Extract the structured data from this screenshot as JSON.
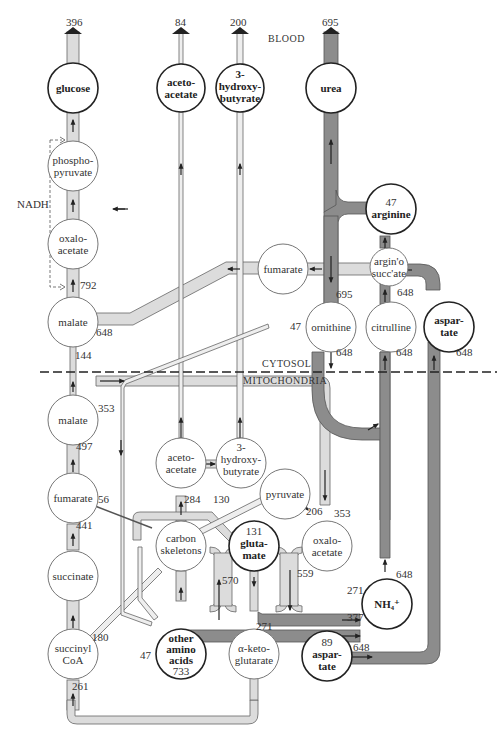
{
  "regions": {
    "blood": "BLOOD",
    "cytosol": "CYTOSOL",
    "mitochondria": "MITOCHONDRIA"
  },
  "cofactor_label": "NADH",
  "colors": {
    "light_flux": "#dcdcdc",
    "dark_flux": "#8c8c8c",
    "outline": "#555555",
    "node_stroke": "#666666",
    "node_bold_stroke": "#222222"
  },
  "outputs": {
    "glucose": "396",
    "acetoacetate": "84",
    "hydroxybutyrate": "200",
    "urea": "695"
  },
  "nodes": {
    "glucose": [
      "glucose"
    ],
    "aceto_blood": [
      "aceto-",
      "acetate"
    ],
    "hb_blood": [
      "3-",
      "hydroxy-",
      "butyrate"
    ],
    "urea": [
      "urea"
    ],
    "phosphopyruvate": [
      "phospho-",
      "pyruvate"
    ],
    "oxalo_cyt": [
      "oxalo-",
      "acetate"
    ],
    "malate_cyt": [
      "malate"
    ],
    "fumarate_cyt": [
      "fumarate"
    ],
    "arginine": [
      "47",
      "arginine"
    ],
    "argsucc": [
      "argin'o",
      "succ'ate"
    ],
    "ornithine": [
      "ornithine"
    ],
    "citrulline": [
      "citrulline"
    ],
    "aspartate_cyt": [
      "aspar-",
      "tate"
    ],
    "malate_mit": [
      "malate"
    ],
    "fumarate_mit": [
      "fumarate"
    ],
    "succinate": [
      "succinate"
    ],
    "succinylcoa": [
      "succinyl",
      "CoA"
    ],
    "aceto_mit": [
      "aceto-",
      "acetate"
    ],
    "hb_mit": [
      "3-",
      "hydroxy-",
      "butyrate"
    ],
    "pyruvate": [
      "pyruvate"
    ],
    "carbon": [
      "carbon",
      "skeletons"
    ],
    "glutamate": [
      "131",
      "gluta-",
      "mate"
    ],
    "oxalo_mit": [
      "oxalo-",
      "acetate"
    ],
    "nh4": [
      "NH₄⁺"
    ],
    "other_aa": [
      "other",
      "amino",
      "acids",
      "733"
    ],
    "akg": [
      "α-keto-",
      "glutarate"
    ],
    "aspartate_mit": [
      "89",
      "aspar-",
      "tate"
    ]
  },
  "flux_labels": {
    "oxalo_malate": "792",
    "malate_fumarate": "648",
    "malate_transport": "144",
    "ornithine_in": "47",
    "ornithine_top": "695",
    "ornithine_bottom": "648",
    "citrulline_top": "648",
    "citrulline_bottom": "648",
    "aspartate_cyt": "648",
    "malate_mit": "353",
    "fumarate_malate": "497",
    "fumarate_carbon": "56",
    "succinate_fumarate": "441",
    "aceto_carbon": "284",
    "carbon_glutamate": "130",
    "pyruvate_oxalo": "206",
    "oxalo_in": "353",
    "glut_aa": "570",
    "oxalo_asp": "559",
    "nh4_glut": "271",
    "nh4_aa": "377",
    "nh4_out": "648",
    "akg_glut": "271",
    "asp_out": "648",
    "succinyl_carbon": "180",
    "aa_in": "47",
    "succinyl_in": "261"
  }
}
